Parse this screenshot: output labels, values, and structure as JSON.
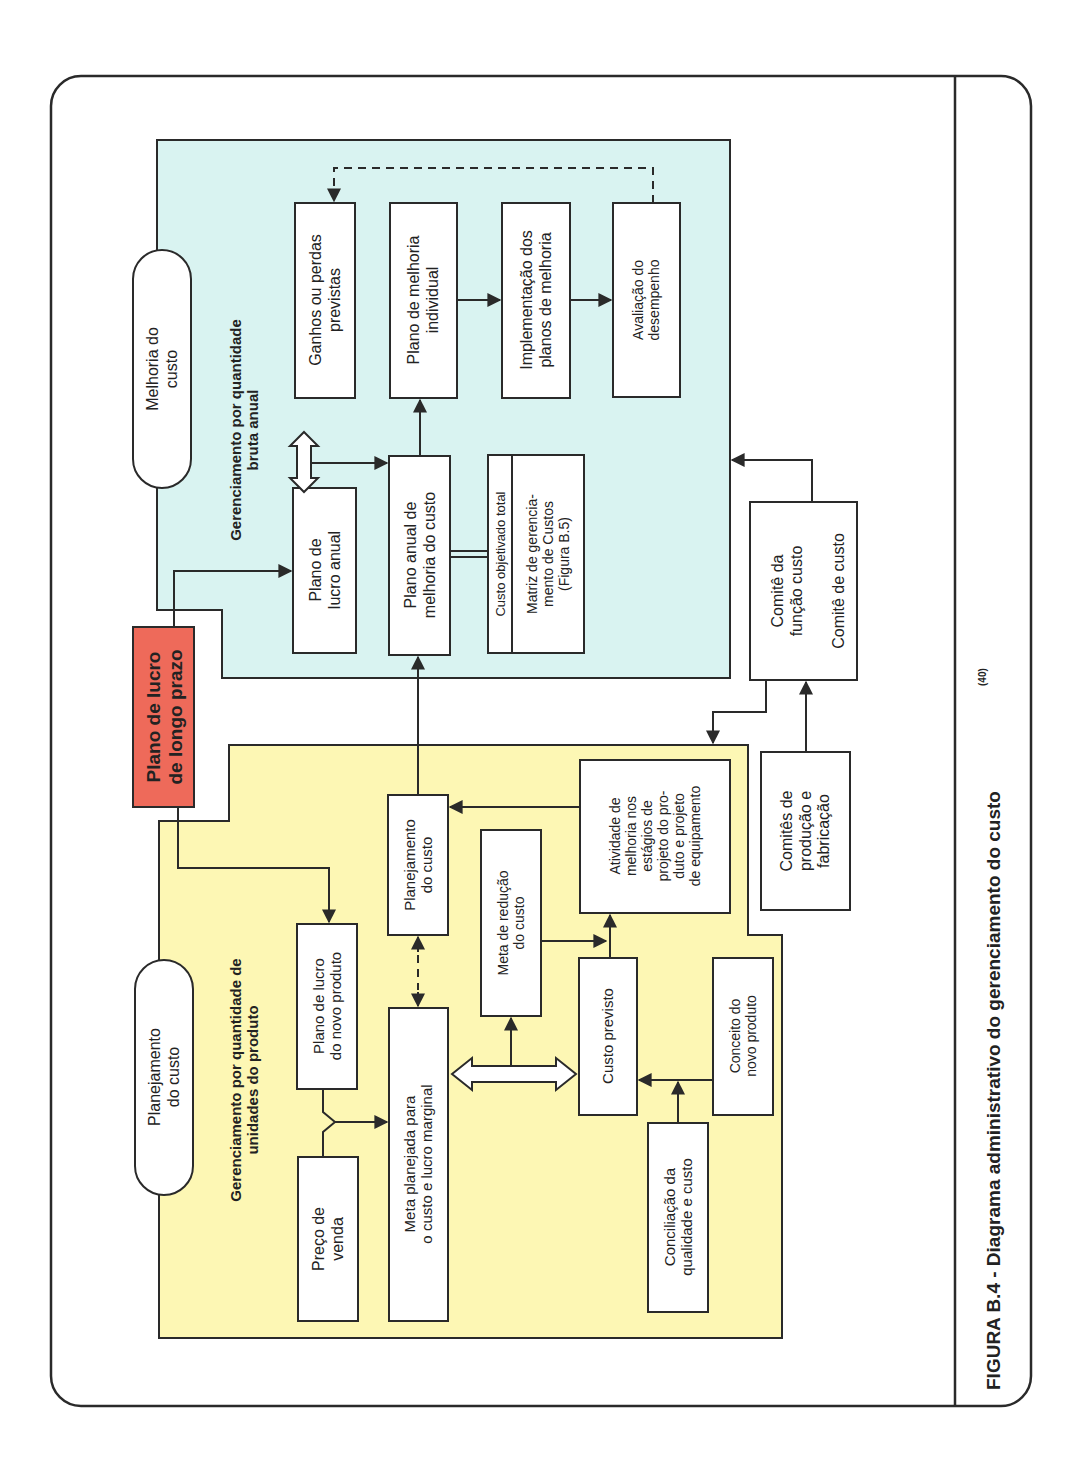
{
  "figure": {
    "caption": "FIGURA B.4 - Diagrama administrativo do gerenciamento do custo",
    "caption_ref": "(40)"
  },
  "colors": {
    "cyan_region": "#d9f3f1",
    "yellow_region": "#fdf7b4",
    "red_box": "#ee6a5a",
    "line": "#2a2a2a"
  },
  "regions": {
    "melhoria": {
      "pill_label": [
        "Melhoria do",
        "custo"
      ],
      "title": [
        "Gerenciamento por quantidade",
        "bruta anual"
      ]
    },
    "planejamento": {
      "pill_label": [
        "Planejamento",
        "do custo"
      ],
      "title": [
        "Gerenciamento por quantidade de",
        "unidades do produto"
      ]
    }
  },
  "nodes": {
    "plano_longo_prazo": [
      "Plano de lucro",
      "de longo prazo"
    ],
    "ganhos_perdas": [
      "Ganhos ou perdas",
      "previstas"
    ],
    "plano_melhoria_individual": [
      "Plano de melhoria",
      "individual"
    ],
    "implementacao": [
      "Implementação dos",
      "planos de melhoria"
    ],
    "avaliacao": [
      "Avaliação do",
      "desempenho"
    ],
    "plano_lucro_anual": [
      "Plano de",
      "lucro anual"
    ],
    "plano_anual_melhoria": [
      "Plano anual de",
      "melhoria do custo"
    ],
    "custo_objetivado": [
      "Custo objetivado total"
    ],
    "matriz": [
      "Matriz de gerencia-",
      "mento de Custos",
      "(Figura B.5)"
    ],
    "comite_funcao": [
      "Comitê da",
      "função custo"
    ],
    "comite_custo": [
      "Comitê de custo"
    ],
    "comites_producao": [
      "Comitês de",
      "produção e",
      "fabricação"
    ],
    "plano_lucro_novo": [
      "Plano de lucro",
      "do novo produto"
    ],
    "preco_venda": [
      "Preço de",
      "venda"
    ],
    "planejamento_custo": [
      "Planejamento",
      "do custo"
    ],
    "meta_planejada": [
      "Meta planejada para",
      "o custo e lucro marginal"
    ],
    "meta_reducao": [
      "Meta de redução",
      "do custo"
    ],
    "atividade": [
      "Atividade de",
      "melhoria nos",
      "estágios de",
      "projeto do pro-",
      "duto e projeto",
      "de equipamento"
    ],
    "custo_previsto": [
      "Custo previsto"
    ],
    "conceito": [
      "Conceito do",
      "novo produto"
    ],
    "conciliacao": [
      "Conciliação da",
      "qualidade e custo"
    ]
  }
}
